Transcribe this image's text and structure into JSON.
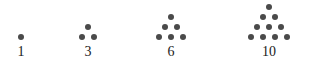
{
  "figure": {
    "background_color": "#ffffff",
    "dot_color": "#4a4a4a",
    "label_color": "#1a1a1a",
    "dot_diameter_px": 6,
    "row_spacing_px": 10,
    "column_spacing_px": 12,
    "groups": [
      {
        "label": "1",
        "rows": 1,
        "dot_count": 1,
        "center_x": 21,
        "baseline_y": 37
      },
      {
        "label": "3",
        "rows": 2,
        "dot_count": 3,
        "center_x": 88,
        "baseline_y": 37
      },
      {
        "label": "6",
        "rows": 3,
        "dot_count": 6,
        "center_x": 171,
        "baseline_y": 37
      },
      {
        "label": "10",
        "rows": 4,
        "dot_count": 10,
        "center_x": 269,
        "baseline_y": 37
      }
    ]
  },
  "chart_data": {
    "type": "scatter",
    "xlabel": "",
    "ylabel": "",
    "categories": [
      "1",
      "3",
      "6",
      "10"
    ],
    "values": [
      1,
      3,
      6,
      10
    ],
    "series": [
      {
        "name": "Triangular number dot patterns",
        "values": [
          1,
          3,
          6,
          10
        ]
      }
    ],
    "annotations": [
      "1",
      "3",
      "6",
      "10"
    ],
    "legend": [],
    "grid": false
  }
}
